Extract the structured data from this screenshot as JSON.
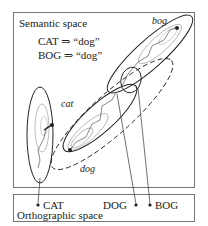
{
  "semantic_panel": {
    "title": "Semantic space",
    "mappings": [
      "CAT ⇒ “dog”",
      "BOG ⇒ “dog”"
    ],
    "regions": [
      {
        "label": "cat",
        "style": "solid-ellipse-vertical"
      },
      {
        "label": "dog",
        "style": "dashed-ellipse-diagonal"
      },
      {
        "label": "bog",
        "style": "solid-ellipse-diagonal"
      }
    ]
  },
  "orthographic_panel": {
    "title": "Orthographic space",
    "words": [
      {
        "label": "CAT"
      },
      {
        "label": "DOG"
      },
      {
        "label": "BOG"
      }
    ]
  },
  "colors": {
    "ink": "#222222",
    "contour_light": "#aaaaaa",
    "frame": "#666666"
  }
}
